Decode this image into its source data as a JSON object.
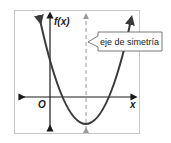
{
  "diagram": {
    "type": "parabola-graph",
    "labels": {
      "y_axis": "f(x)",
      "x_axis": "x",
      "origin": "O",
      "callout": "eje de simetría"
    },
    "colors": {
      "curve": "#3a3a3a",
      "axes": "#1a1a1a",
      "symmetry_line": "#9a9a9a",
      "frame": "#c8c8c8",
      "background": "#ffffff"
    },
    "elements": [
      {
        "name": "upward-opening parabola",
        "vertex_approx_px": [
          86,
          125
        ]
      },
      {
        "name": "vertical dashed axis of symmetry through the vertex"
      },
      {
        "name": "x-axis with arrows at both ends"
      },
      {
        "name": "y-axis with arrows at both ends"
      },
      {
        "name": "callout box pointing to axis of symmetry"
      }
    ]
  }
}
